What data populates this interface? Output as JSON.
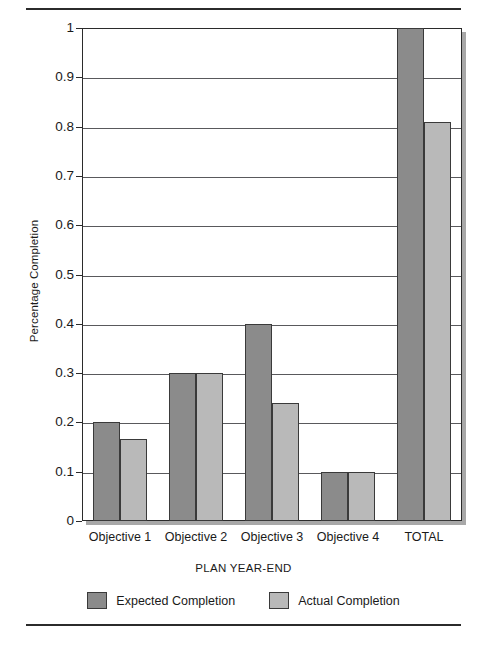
{
  "chart_data": {
    "type": "bar",
    "title": "",
    "xlabel": "PLAN YEAR-END",
    "ylabel": "Percentage Completion",
    "categories": [
      "Objective 1",
      "Objective 2",
      "Objective 3",
      "Objective 4",
      "TOTAL"
    ],
    "series": [
      {
        "name": "Expected Completion",
        "color": "#8b8b8b",
        "values": [
          0.2,
          0.3,
          0.4,
          0.1,
          1.0
        ]
      },
      {
        "name": "Actual Completion",
        "color": "#b9b9b9",
        "values": [
          0.167,
          0.3,
          0.24,
          0.1,
          0.81
        ]
      }
    ],
    "ylim": [
      0,
      1
    ],
    "yticks": [
      0,
      0.1,
      0.2,
      0.3,
      0.4,
      0.5,
      0.6,
      0.7,
      0.8,
      0.9,
      1
    ],
    "ytick_labels": [
      "0",
      "0.1",
      "0.2",
      "0.3",
      "0.4",
      "0.5",
      "0.6",
      "0.7",
      "0.8",
      "0.9",
      "1"
    ],
    "grid": true,
    "grid_axis": "y",
    "legend_position": "bottom"
  },
  "rules": {
    "top": "horizontal-rule",
    "bottom": "horizontal-rule"
  }
}
